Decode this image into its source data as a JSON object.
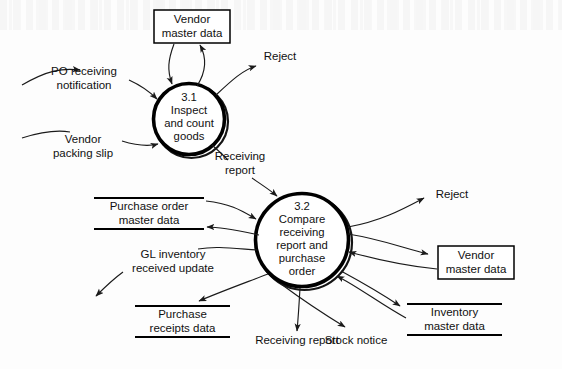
{
  "diagram": {
    "type": "data-flow-diagram",
    "background_color": "#fdfdfd",
    "line_color": "#1a1a1a",
    "processes": [
      {
        "id": "3.1",
        "number": "3.1",
        "name": "Inspect\nand count\ngoods",
        "full_label": "3.1\nInspect\nand count\ngoods",
        "cx": 189,
        "cy": 119,
        "r": 36
      },
      {
        "id": "3.2",
        "number": "3.2",
        "name": "Compare\nreceiving\nreport and\npurchase\norder",
        "full_label": "3.2\nCompare\nreceiving\nreport and\npurchase\norder",
        "cx": 302,
        "cy": 240,
        "r": 47
      }
    ],
    "data_stores": [
      {
        "id": "vendor-master-data-top",
        "label": "Vendor\nmaster data",
        "shape": "rectangle"
      },
      {
        "id": "purchase-order-master-data",
        "label": "Purchase order\nmaster data",
        "shape": "open-ended"
      },
      {
        "id": "purchase-receipts-data",
        "label": "Purchase\nreceipts data",
        "shape": "open-ended"
      },
      {
        "id": "vendor-master-data-right",
        "label": "Vendor\nmaster data",
        "shape": "rectangle"
      },
      {
        "id": "inventory-master-data",
        "label": "Inventory\nmaster data",
        "shape": "open-ended"
      }
    ],
    "flow_labels": [
      {
        "id": "po-receiving-notification",
        "label": "PO receiving\nnotification"
      },
      {
        "id": "vendor-packing-slip",
        "label": "Vendor\npacking slip"
      },
      {
        "id": "reject-top",
        "label": "Reject"
      },
      {
        "id": "receiving-report-mid",
        "label": "Receiving\nreport"
      },
      {
        "id": "gl-inventory-received-update",
        "label": "GL inventory\nreceived update"
      },
      {
        "id": "reject-right",
        "label": "Reject"
      },
      {
        "id": "receiving-report-bottom",
        "label": "Receiving report"
      },
      {
        "id": "stock-notice",
        "label": "Stock notice"
      }
    ]
  }
}
